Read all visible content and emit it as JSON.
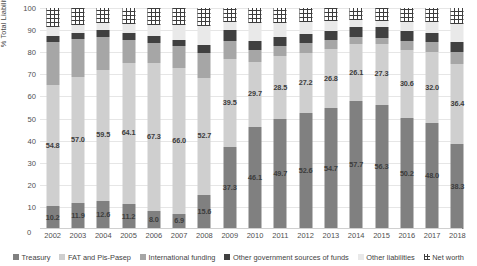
{
  "axes": {
    "ylabel": "% Total Liabilities",
    "yticks": [
      100,
      90,
      80,
      70,
      60,
      50,
      40,
      30,
      20,
      10,
      0
    ],
    "xticks": [
      "2002",
      "2003",
      "2004",
      "2005",
      "2006",
      "2007",
      "2008",
      "2009",
      "2010",
      "2011",
      "2012",
      "2013",
      "2014",
      "2015",
      "2016",
      "2017",
      "2018"
    ]
  },
  "legend": {
    "items": [
      {
        "label": "Treasury",
        "color": "#808080",
        "icon": "square-swatch-icon"
      },
      {
        "label": "FAT and Pis-Pasep",
        "color": "#cfcfcf",
        "icon": "square-swatch-icon"
      },
      {
        "label": "International funding",
        "color": "#a6a6a6",
        "icon": "square-swatch-icon"
      },
      {
        "label": "Other government sources of funds",
        "color": "#404040",
        "icon": "square-swatch-icon"
      },
      {
        "label": "Other liabilities",
        "color": "#e9e9e9",
        "icon": "square-swatch-icon"
      },
      {
        "label": "Net worth",
        "color": "#3d3d3d",
        "icon": "hatched-swatch-icon"
      }
    ]
  },
  "chart_data": {
    "type": "bar",
    "title": "",
    "xlabel": "",
    "ylabel": "% Total Liabilities",
    "ylim": [
      0,
      100
    ],
    "grid": true,
    "stacked": true,
    "normalized_percent": true,
    "legend_position": "bottom",
    "categories": [
      "2002",
      "2003",
      "2004",
      "2005",
      "2006",
      "2007",
      "2008",
      "2009",
      "2010",
      "2011",
      "2012",
      "2013",
      "2014",
      "2015",
      "2016",
      "2017",
      "2018"
    ],
    "series": [
      {
        "name": "Treasury",
        "color": "#808080",
        "values": [
          10.2,
          11.9,
          12.6,
          11.2,
          8.0,
          6.9,
          15.6,
          37.3,
          46.1,
          49.7,
          52.6,
          54.7,
          57.7,
          56.3,
          50.2,
          48.0,
          38.3
        ],
        "labels": [
          "10.2",
          "11.9",
          "12.6",
          "11.2",
          "8.0",
          "6.9",
          "15.6",
          "37.3",
          "46.1",
          "49.7",
          "52.6",
          "54.7",
          "57.7",
          "56.3",
          "50.2",
          "48.0",
          "38.3"
        ]
      },
      {
        "name": "FAT and Pis-Pasep",
        "color": "#cfcfcf",
        "values": [
          54.8,
          57.0,
          59.5,
          64.1,
          67.3,
          66.0,
          52.7,
          39.5,
          29.7,
          28.5,
          27.2,
          26.8,
          26.1,
          27.3,
          30.6,
          32.0,
          36.4
        ],
        "labels": [
          "54.8",
          "57.0",
          "59.5",
          "64.1",
          "67.3",
          "66.0",
          "52.7",
          "39.5",
          "29.7",
          "28.5",
          "27.2",
          "26.8",
          "26.1",
          "27.3",
          "30.6",
          "32.0",
          "36.4"
        ]
      },
      {
        "name": "International funding",
        "color": "#a6a6a6",
        "values": [
          19.5,
          17.1,
          14.7,
          10.2,
          8.8,
          9.8,
          11.5,
          8.1,
          5.3,
          4.4,
          4.3,
          3.9,
          3.2,
          3.0,
          4.1,
          4.4,
          5.6
        ],
        "labels": []
      },
      {
        "name": "Other government sources of funds",
        "color": "#404040",
        "values": [
          2.7,
          2.9,
          3.2,
          3.1,
          3.2,
          2.7,
          3.6,
          5.1,
          3.9,
          4.1,
          4.0,
          4.3,
          4.6,
          4.9,
          4.6,
          4.1,
          4.3
        ],
        "labels": []
      },
      {
        "name": "Other liabilities",
        "color": "#e9e9e9",
        "values": [
          4.1,
          3.6,
          3.4,
          4.1,
          5.0,
          7.1,
          8.6,
          3.6,
          8.3,
          6.6,
          5.8,
          4.6,
          2.9,
          2.8,
          4.2,
          5.0,
          8.1
        ],
        "labels": []
      },
      {
        "name": "Net worth",
        "color": "#3d3d3d",
        "pattern": "hatched",
        "values": [
          8.7,
          7.5,
          6.6,
          7.3,
          7.7,
          7.5,
          8.0,
          6.4,
          6.7,
          6.7,
          6.1,
          5.7,
          5.5,
          5.7,
          6.3,
          6.5,
          7.3
        ],
        "labels": []
      }
    ]
  }
}
